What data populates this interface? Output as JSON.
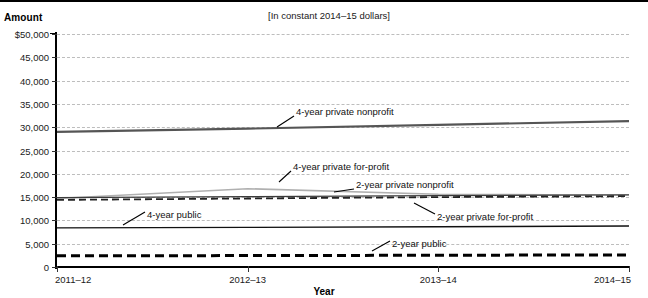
{
  "figure": {
    "clipped_title": "",
    "amount_axis_label": "Amount",
    "subtitle": "[In constant 2014–15 dollars]",
    "xaxis_title": "Year"
  },
  "chart_data": {
    "type": "line",
    "title": "",
    "subtitle": "[In constant 2014–15 dollars]",
    "xlabel": "Year",
    "ylabel": "Amount",
    "categories": [
      "2011–12",
      "2012–13",
      "2013–14",
      "2014–15"
    ],
    "x_tick_labels": [
      "2011–12",
      "2012–13",
      "2013–14",
      "2014–15"
    ],
    "y_tick_labels": [
      "$50,000",
      "45,000",
      "40,000",
      "35,000",
      "30,000",
      "25,000",
      "20,000",
      "15,000",
      "10,000",
      "5,000",
      "0"
    ],
    "y_tick_values": [
      50000,
      45000,
      40000,
      35000,
      30000,
      25000,
      20000,
      15000,
      10000,
      5000,
      0
    ],
    "ylim": [
      0,
      50000
    ],
    "grid": true,
    "grid_style": "dashed-horizontal",
    "legend_position": "inline-annotations",
    "series": [
      {
        "name": "4-year private nonprofit",
        "values": [
          29000,
          29700,
          30500,
          31300
        ],
        "color": "#555555",
        "style": "solid",
        "width": 2.2,
        "label_x": 296,
        "label_y": 104
      },
      {
        "name": "4-year private for-profit",
        "values": [
          14700,
          16800,
          15600,
          15400
        ],
        "color": "#b0b0b0",
        "style": "solid",
        "width": 1.6,
        "label_x": 293,
        "label_y": 159
      },
      {
        "name": "2-year private nonprofit",
        "values": [
          14900,
          15100,
          15300,
          15500
        ],
        "color": "#3b3b3b",
        "style": "solid",
        "width": 1.2,
        "label_x": 356,
        "label_y": 177
      },
      {
        "name": "2-year private for-profit",
        "values": [
          14400,
          14700,
          15000,
          15200
        ],
        "color": "#222222",
        "style": "dashed",
        "width": 1.8,
        "label_x": 437,
        "label_y": 209
      },
      {
        "name": "4-year public",
        "values": [
          8400,
          8500,
          8650,
          8800
        ],
        "color": "#111111",
        "style": "solid",
        "width": 1.4,
        "label_x": 147,
        "label_y": 207
      },
      {
        "name": "2-year public",
        "values": [
          2400,
          2450,
          2520,
          2600
        ],
        "color": "#000000",
        "style": "dashed-thick",
        "width": 3.0,
        "label_x": 392,
        "label_y": 236
      }
    ],
    "annotations": [
      {
        "text": "4-year private nonprofit",
        "leader_from": [
          294,
          114
        ],
        "leader_to": [
          277,
          125
        ]
      },
      {
        "text": "4-year private for-profit",
        "leader_from": [
          291,
          169
        ],
        "leader_to": [
          279,
          180
        ]
      },
      {
        "text": "2-year private nonprofit",
        "leader_from": [
          354,
          187
        ],
        "leader_to": [
          334,
          190
        ]
      },
      {
        "text": "2-year private for-profit",
        "leader_from": [
          435,
          212
        ],
        "leader_to": [
          414,
          201
        ]
      },
      {
        "text": "4-year public",
        "leader_from": [
          145,
          210
        ],
        "leader_to": [
          123,
          223
        ]
      },
      {
        "text": "2-year public",
        "leader_from": [
          390,
          239
        ],
        "leader_to": [
          372,
          249
        ]
      }
    ]
  }
}
